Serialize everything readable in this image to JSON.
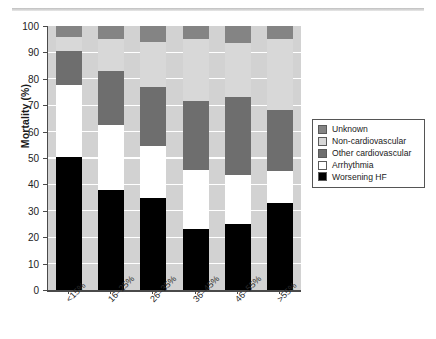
{
  "chart_data": {
    "type": "bar",
    "subtype": "stacked-bar-100-percent",
    "title": "",
    "xlabel": "",
    "ylabel": "Mortality (%)",
    "ylim": [
      0,
      100
    ],
    "ytick_step": 10,
    "yticks": [
      "100",
      "90",
      "80",
      "70",
      "60",
      "50",
      "40",
      "30",
      "20",
      "10",
      "0"
    ],
    "grid": "horizontal-white",
    "legend_position": "right",
    "categories": [
      "<15%",
      "16–25%",
      "26–35%",
      "36–45%",
      "46–55%",
      ">55%"
    ],
    "series": [
      {
        "name": "Worsening HF",
        "color": "#000000",
        "values": [
          50.5,
          38.0,
          35.0,
          23.0,
          25.0,
          33.0
        ]
      },
      {
        "name": "Arrhythmia",
        "color": "#ffffff",
        "values": [
          27.0,
          24.5,
          19.5,
          22.5,
          18.5,
          12.0
        ]
      },
      {
        "name": "Other cardiovascular",
        "color": "#6e6e6e",
        "values": [
          13.0,
          20.5,
          22.5,
          26.0,
          29.5,
          23.0
        ]
      },
      {
        "name": "Non-cardiovascular",
        "color": "#d8d8d8",
        "values": [
          5.5,
          12.0,
          17.0,
          23.5,
          20.5,
          27.0
        ]
      },
      {
        "name": "Unknown",
        "color": "#848484",
        "values": [
          4.0,
          5.0,
          6.0,
          5.0,
          6.5,
          5.0
        ]
      }
    ],
    "cumulative_tops": {
      "<15%": {
        "worsening_hf": 50.5,
        "arrhythmia": 77.5,
        "other_cardiovascular": 90.5,
        "non_cardiovascular": 96.0,
        "unknown": 100
      },
      "16-25%": {
        "worsening_hf": 38.0,
        "arrhythmia": 62.5,
        "other_cardiovascular": 83.0,
        "non_cardiovascular": 95.0,
        "unknown": 100
      },
      "26-35%": {
        "worsening_hf": 35.0,
        "arrhythmia": 54.5,
        "other_cardiovascular": 77.0,
        "non_cardiovascular": 94.0,
        "unknown": 100
      },
      "36-45%": {
        "worsening_hf": 23.0,
        "arrhythmia": 45.5,
        "other_cardiovascular": 71.5,
        "non_cardiovascular": 95.0,
        "unknown": 100
      },
      "46-55%": {
        "worsening_hf": 25.0,
        "arrhythmia": 43.5,
        "other_cardiovascular": 73.0,
        "non_cardiovascular": 93.5,
        "unknown": 100
      },
      ">55%": {
        "worsening_hf": 33.0,
        "arrhythmia": 45.0,
        "other_cardiovascular": 68.0,
        "non_cardiovascular": 95.0,
        "unknown": 100
      }
    }
  },
  "legend": {
    "items": [
      {
        "label": "Unknown",
        "color": "#848484"
      },
      {
        "label": "Non-cardiovascular",
        "color": "#d8d8d8"
      },
      {
        "label": "Other cardiovascular",
        "color": "#6e6e6e"
      },
      {
        "label": "Arrhythmia",
        "color": "#ffffff"
      },
      {
        "label": "Worsening HF",
        "color": "#000000"
      }
    ]
  },
  "axes": {
    "y_title": "Mortality (%)"
  },
  "colors": {
    "plot_background": "#d2d2d2",
    "gridline": "#ffffff",
    "axis": "#4a4a4a",
    "page_background": "#ffffff"
  }
}
